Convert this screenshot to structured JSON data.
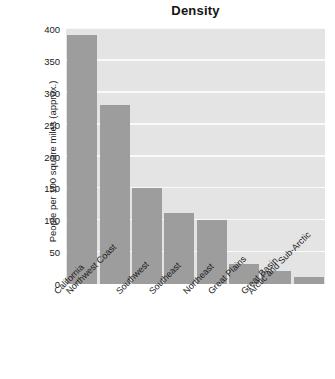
{
  "chart_data": {
    "type": "bar",
    "title": "Density",
    "xlabel": "",
    "ylabel": "People per 100 square miles (approx.)",
    "categories": [
      "California",
      "Northwest Coast",
      "Southwest",
      "Southeast",
      "Northeast",
      "Great Plains",
      "Great Basin",
      "Arctic and Sub-Arctic"
    ],
    "values": [
      390,
      281,
      151,
      111,
      101,
      31,
      21,
      11
    ],
    "ylim": [
      0,
      400
    ],
    "yticks": [
      0,
      50,
      100,
      150,
      200,
      250,
      300,
      350,
      400
    ],
    "ytick_labels": [
      "0",
      "50",
      "100",
      "150",
      "200",
      "250",
      "300",
      "350",
      "400"
    ],
    "grid": true,
    "legend": false,
    "bar_color": "#9d9d9d",
    "plot_background": "#e4e4e4",
    "gridline_color": "#fafafa",
    "figure_background": "#ffffff",
    "xtick_rotation": -45
  }
}
